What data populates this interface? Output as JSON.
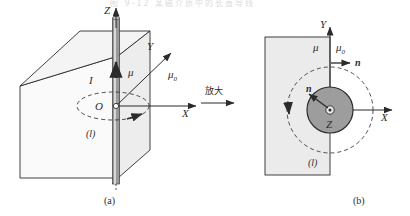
{
  "figure": {
    "top_cropped_text": "图 9-12  某磁介质中的长直导线",
    "transition_label": "放大",
    "panel_a": {
      "caption": "(a)",
      "axis_z": "Z",
      "axis_y": "Y",
      "axis_x": "X",
      "origin": "O",
      "current_label": "I",
      "mu_label": "μ",
      "mu0_label": "μ",
      "mu0_sub": "0",
      "loop_label": "(l)"
    },
    "panel_b": {
      "caption": "(b)",
      "axis_y": "Y",
      "axis_x": "X",
      "axis_z": "Z",
      "mu_label": "μ",
      "mu0_label": "μ",
      "mu0_sub": "0",
      "normal_outer_label": "n",
      "normal_inner_label": "n",
      "loop_label": "(l)"
    }
  },
  "colors": {
    "stroke": "#2b2b2b",
    "box_front_fill": "#fafafa",
    "box_top_fill": "#f1f1f1",
    "box_side_fill": "#ededed",
    "rect_fill": "#ebebeb",
    "disc_fill": "#9d9d9d",
    "wire_fill": "#8f8f8f",
    "dashed": "#555555",
    "text": "#2b2b2b"
  }
}
